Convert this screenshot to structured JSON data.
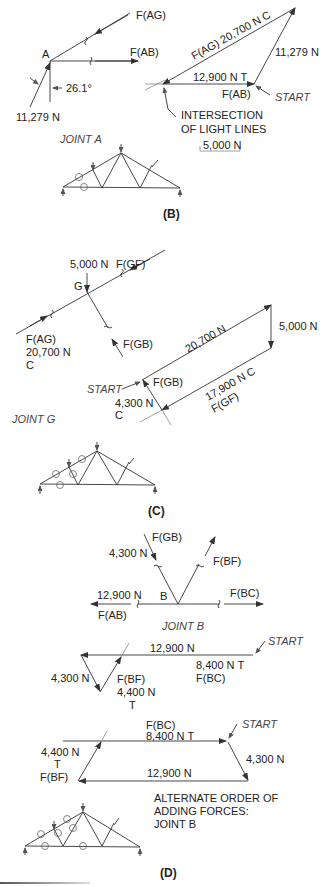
{
  "panels": {
    "B": {
      "caption": "(B)",
      "joint_label": "JOINT A",
      "node": "A",
      "fbd": {
        "f_ag": "F(AG)",
        "f_ab": "F(AB)",
        "angle": "26.1°",
        "reaction": "11,279 N"
      },
      "polygon": {
        "f_ag": "F(AG)  20,700 N C",
        "reaction": "11,279 N",
        "f_ab_value": "12,900 N T",
        "f_ab": "F(AB)",
        "start": "START",
        "note_line1": "INTERSECTION",
        "note_line2": "OF LIGHT LINES",
        "scale": "5,000 N"
      }
    },
    "C": {
      "caption": "(C)",
      "joint_label": "JOINT G",
      "node": "G",
      "fbd": {
        "load": "5,000 N",
        "f_gf": "F(GF)",
        "f_ag": "F(AG)",
        "f_ag_value": "20,700 N",
        "f_ag_type": "C",
        "f_gb": "F(GB)"
      },
      "polygon": {
        "f_ag_value": "20,700 N",
        "load": "5,000 N",
        "start": "START",
        "f_gb": "F(GB)",
        "f_gb_value": "4,300 N",
        "f_gb_type": "C",
        "f_gf_value": "17,900 N C",
        "f_gf": "F(GF)"
      }
    },
    "D": {
      "caption": "(D)",
      "joint_label": "JOINT B",
      "node": "B",
      "fbd": {
        "f_gb": "F(GB)",
        "f_gb_value": "4,300 N",
        "f_bf": "F(BF)",
        "f_ab_value": "12,900 N",
        "f_ab": "F(AB)",
        "f_bc": "F(BC)"
      },
      "polygon1": {
        "top_value": "12,900 N",
        "start": "START",
        "f_bc_value": "8,400 N T",
        "f_bc": "F(BC)",
        "left_value": "4,300 N",
        "f_bf": "F(BF)",
        "f_bf_value": "4,400 N",
        "f_bf_type": "T"
      },
      "polygon2": {
        "f_bc": "F(BC)",
        "f_bc_value": "8,400 N T",
        "start": "START",
        "right_value": "4,300 N",
        "f_bf_value": "4,400 N",
        "f_bf_type": "T",
        "f_bf": "F(BF)",
        "bottom_value": "12,900 N",
        "note_line1": "ALTERNATE ORDER OF",
        "note_line2": "ADDING FORCES:",
        "note_line3": "JOINT B"
      }
    }
  }
}
